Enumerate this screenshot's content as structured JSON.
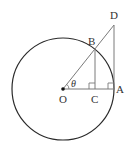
{
  "diagram": {
    "type": "unit-circle-trigonometry",
    "colors": {
      "circle": "#2a2a2a",
      "lines": "#7a7a7a",
      "labels": "#333333",
      "background": "#ffffff"
    },
    "circle": {
      "center": "O",
      "cx": 63,
      "cy": 89,
      "r": 51
    },
    "points": {
      "O": {
        "label": "O",
        "x": 63,
        "y": 89
      },
      "A": {
        "label": "A",
        "x": 114,
        "y": 89
      },
      "B": {
        "label": "B",
        "x": 95,
        "y": 49
      },
      "C": {
        "label": "C",
        "x": 95,
        "y": 89
      },
      "D": {
        "label": "D",
        "x": 114,
        "y": 25
      }
    },
    "segments": [
      "OA",
      "OD",
      "BC",
      "AD"
    ],
    "right_angles": [
      "C",
      "A"
    ],
    "angle": {
      "vertex": "O",
      "label": "θ",
      "between": [
        "OA",
        "OD"
      ]
    }
  }
}
